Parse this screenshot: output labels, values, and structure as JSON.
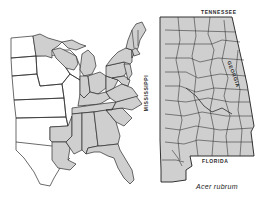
{
  "figure": {
    "caption": "Acer rubrum",
    "fill_color": "#cfcfcf",
    "line_color": "#2b2b2b",
    "background": "#ffffff"
  },
  "left_map": {
    "region": "Eastern United States",
    "description": "Shaded states indicate species range"
  },
  "right_map": {
    "region": "Alabama (county map)",
    "labels": {
      "north": "TENNESSEE",
      "west": "MISSISSIPPI",
      "east": "GEORGIA",
      "south": "FLORIDA"
    }
  }
}
